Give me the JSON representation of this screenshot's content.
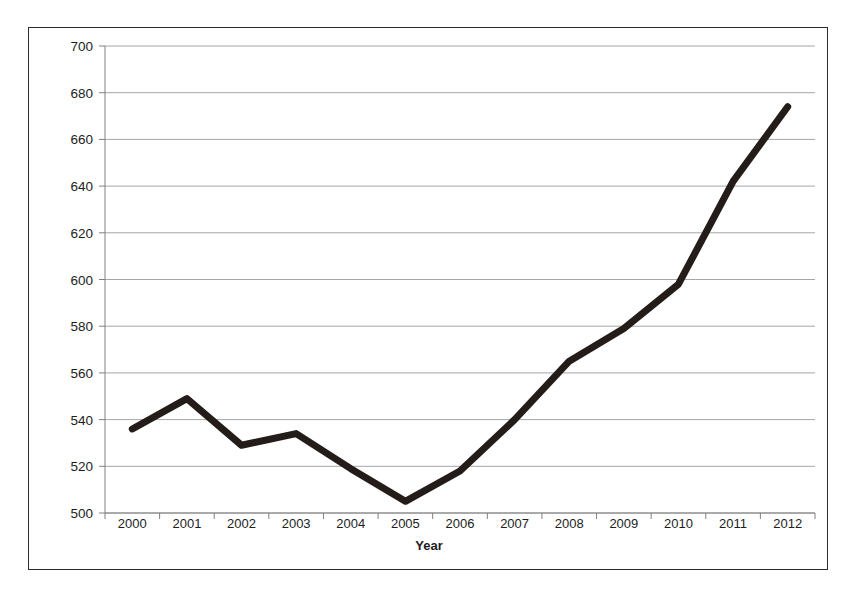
{
  "chart_data": {
    "type": "line",
    "title": "",
    "xlabel": "Year",
    "ylabel": "Billion Cubic Meters",
    "categories": [
      "2000",
      "2001",
      "2002",
      "2003",
      "2004",
      "2005",
      "2006",
      "2007",
      "2008",
      "2009",
      "2010",
      "2011",
      "2012"
    ],
    "values": [
      536,
      549,
      529,
      534,
      519,
      505,
      518,
      540,
      565,
      579,
      598,
      642,
      674
    ],
    "series": [
      {
        "name": "Billion Cubic Meters",
        "values": [
          536,
          549,
          529,
          534,
          519,
          505,
          518,
          540,
          565,
          579,
          598,
          642,
          674
        ]
      }
    ],
    "ylim": [
      500,
      700
    ],
    "ytick_labels": [
      "700",
      "680",
      "660",
      "640",
      "620",
      "600",
      "580",
      "560",
      "540",
      "520",
      "500"
    ],
    "ytick_values": [
      700,
      680,
      660,
      640,
      620,
      600,
      580,
      560,
      540,
      520,
      500
    ],
    "xtick_labels": [
      "2000",
      "2001",
      "2002",
      "2003",
      "2004",
      "2005",
      "2006",
      "2007",
      "2008",
      "2009",
      "2010",
      "2011",
      "2012"
    ],
    "grid": true,
    "legend": "none",
    "line_color": "#231c19",
    "grid_color": "#a6a6a6",
    "axis_color": "#808080",
    "plot_background": "#ffffff"
  },
  "figure": {
    "border_color": "#2b2b2b",
    "background": "#ffffff",
    "caption": ""
  }
}
